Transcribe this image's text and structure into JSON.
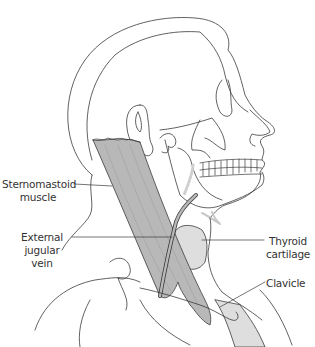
{
  "figure": {
    "labels": [
      {
        "id": "sternomastoid",
        "line1": "Sternomastoid",
        "line2": "muscle"
      },
      {
        "id": "external-jugular",
        "line1": "External",
        "line2": "jugular",
        "line3": "vein"
      },
      {
        "id": "thyroid",
        "line1": "Thyroid",
        "line2": "cartilage"
      },
      {
        "id": "clavicle",
        "line1": "Clavicle"
      }
    ]
  },
  "colors": {
    "outline": "#3a3a3a",
    "muscle_fill": "#b8b8b8",
    "light_fill": "#dedede",
    "label_text": "#333333",
    "background": "#ffffff"
  }
}
